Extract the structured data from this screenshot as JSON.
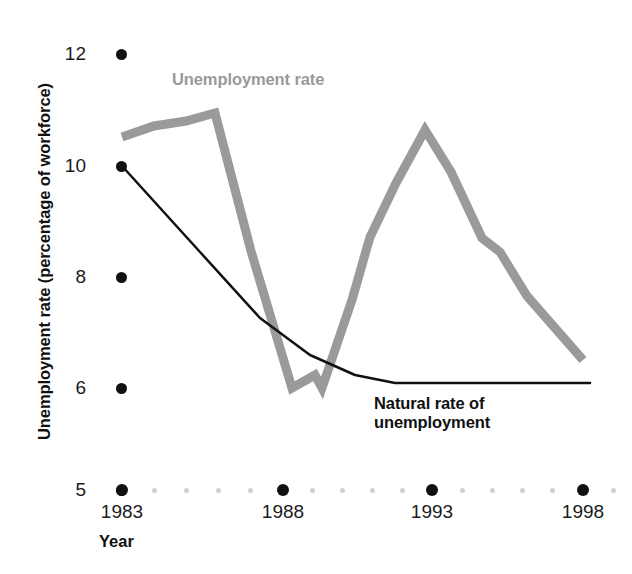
{
  "figure": {
    "y_axis_title": "Unemployment rate (percentage of workforce)",
    "x_axis_title": "Year",
    "background_color": "#ffffff"
  },
  "series_labels": {
    "unemployment_rate": "Unemployment rate",
    "natural_rate_line1": "Natural rate of",
    "natural_rate_line2": "unemployment"
  },
  "axes": {
    "y_ticks": [
      {
        "label": "12",
        "value": 12,
        "py": 54
      },
      {
        "label": "10",
        "value": 10,
        "py": 166
      },
      {
        "label": "8",
        "value": 8,
        "py": 277
      },
      {
        "label": "6",
        "value": 6,
        "py": 388
      },
      {
        "label": "5",
        "value": 5,
        "py": 490
      }
    ],
    "x_ticks": [
      {
        "label": "1983",
        "value": 1983,
        "px": 122
      },
      {
        "label": "1988",
        "value": 1988,
        "px": 283
      },
      {
        "label": "1993",
        "value": 1993,
        "px": 432
      },
      {
        "label": "1998",
        "value": 1998,
        "px": 583
      }
    ],
    "x_minor_dots_between_majors": 4,
    "axis_dot_color": "#111111",
    "minor_dot_color": "#d0d0d0"
  },
  "colors": {
    "unemployment_rate": "#9a9a9a",
    "natural_rate": "#111111",
    "text": "#111111"
  },
  "chart_data": {
    "type": "line",
    "title": "",
    "xlabel": "Year",
    "ylabel": "Unemployment rate (percentage of workforce)",
    "xlim": [
      1983,
      1998
    ],
    "ylim": [
      5,
      12
    ],
    "grid": false,
    "legend": "inline-labels",
    "x": [
      1983,
      1984,
      1985,
      1986,
      1987,
      1988,
      1989,
      1990,
      1991,
      1992,
      1993,
      1994,
      1995,
      1996,
      1997,
      1998
    ],
    "series": [
      {
        "name": "Unemployment rate",
        "color": "#9a9a9a",
        "line_width_px": 9,
        "values": [
          10.6,
          10.9,
          11.0,
          11.0,
          8.9,
          6.0,
          6.2,
          6.0,
          9.1,
          10.5,
          10.7,
          9.6,
          8.6,
          8.3,
          7.5,
          6.4
        ]
      },
      {
        "name": "Natural rate of unemployment",
        "color": "#111111",
        "line_width_px": 2.5,
        "values": [
          10.0,
          9.4,
          8.8,
          8.2,
          7.6,
          7.0,
          6.5,
          6.1,
          6.0,
          6.0,
          6.0,
          6.0,
          6.0,
          6.0,
          6.0,
          6.0
        ]
      }
    ],
    "annotations": [
      {
        "text": "Unemployment rate",
        "x": 1985.5,
        "y": 11.6,
        "color": "#9a9a9a"
      },
      {
        "text": "Natural rate of unemployment",
        "x": 1991.6,
        "y": 5.85,
        "color": "#111111"
      }
    ]
  },
  "geometry": {
    "unemployment_rate_points": [
      [
        122,
        137
      ],
      [
        154,
        126
      ],
      [
        186,
        121
      ],
      [
        215,
        113
      ],
      [
        251,
        251
      ],
      [
        292,
        388
      ],
      [
        315,
        375
      ],
      [
        322,
        388
      ],
      [
        352,
        300
      ],
      [
        370,
        237
      ],
      [
        396,
        183
      ],
      [
        425,
        130
      ],
      [
        451,
        172
      ],
      [
        482,
        238
      ],
      [
        500,
        252
      ],
      [
        527,
        296
      ],
      [
        583,
        360
      ]
    ],
    "natural_rate_points": [
      [
        122,
        166
      ],
      [
        200,
        252
      ],
      [
        260,
        318
      ],
      [
        310,
        355
      ],
      [
        355,
        375
      ],
      [
        395,
        383
      ],
      [
        590,
        383
      ]
    ]
  }
}
